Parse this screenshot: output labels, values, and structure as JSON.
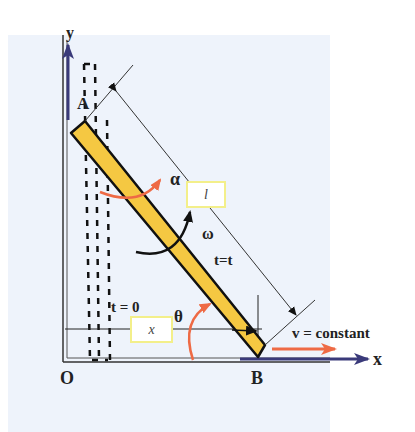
{
  "diagram": {
    "labels": {
      "y_axis": "y",
      "x_axis": "x",
      "origin": "O",
      "point_a": "A",
      "point_b": "B",
      "alpha": "α",
      "omega": "ω",
      "theta": "θ",
      "time_initial": "t = 0",
      "time_current": "t=t",
      "velocity": "v = constant",
      "length_box": "l",
      "x_box": "x"
    },
    "colors": {
      "rod_fill": "#f5c842",
      "rod_stroke": "#111111",
      "axis": "#3a3a7a",
      "accent_orange": "#ee6a45",
      "label_box_border": "#f3ef8a",
      "background_panel": "#eef3fb"
    }
  }
}
